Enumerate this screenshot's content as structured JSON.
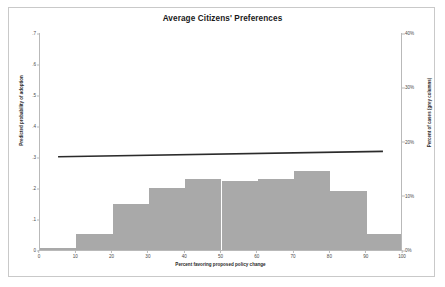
{
  "chart_data": {
    "type": "bar",
    "title": "Average Citizens' Preferences",
    "xlabel": "Percent favoring proposed policy change",
    "ylabel": "Predicted probability of adoption",
    "ylabel_right": "Percent of cases (grey columns)",
    "grid": false,
    "legend": "none",
    "xlim": [
      0,
      100
    ],
    "ylim": [
      0,
      0.7
    ],
    "ylim_right": [
      0,
      40
    ],
    "xticks": [
      "0",
      "10",
      "20",
      "30",
      "40",
      "50",
      "60",
      "70",
      "80",
      "90",
      "100"
    ],
    "xtick_values": [
      0,
      10,
      20,
      30,
      40,
      50,
      60,
      70,
      80,
      90,
      100
    ],
    "yticks_left": [
      ".7",
      ".6",
      ".5",
      ".4",
      ".3",
      ".2",
      ".1",
      "0"
    ],
    "ytick_values_left": [
      0.7,
      0.6,
      0.5,
      0.4,
      0.3,
      0.2,
      0.1,
      0.0
    ],
    "yticks_right": [
      "40%",
      "30%",
      "20%",
      "10%",
      "0%"
    ],
    "ytick_values_right": [
      40,
      30,
      20,
      10,
      0
    ],
    "categories": [
      "0-10",
      "10-20",
      "20-30",
      "30-40",
      "40-50",
      "50-60",
      "60-70",
      "70-80",
      "80-90",
      "90-100"
    ],
    "bin_edges": [
      0,
      10,
      20,
      30,
      40,
      50,
      60,
      70,
      80,
      90,
      100
    ],
    "series": [
      {
        "name": "Percent of cases (grey columns)",
        "axis": "right",
        "type": "bar",
        "color": "#a9a9a9",
        "values": [
          0.3,
          3.0,
          8.5,
          11.5,
          13.0,
          12.8,
          13.0,
          14.5,
          10.8,
          3.0
        ]
      },
      {
        "name": "Predicted probability of adoption",
        "axis": "left",
        "type": "line",
        "color": "#2b2b2b",
        "x": [
          5,
          95
        ],
        "values": [
          0.301,
          0.318
        ]
      }
    ]
  },
  "colors": {
    "bar": "#a9a9a9",
    "line": "#2b2b2b",
    "axis": "#b9b9b9",
    "frame": "#c9c9c9",
    "background": "#ffffff",
    "text": "#2a2a2a"
  }
}
